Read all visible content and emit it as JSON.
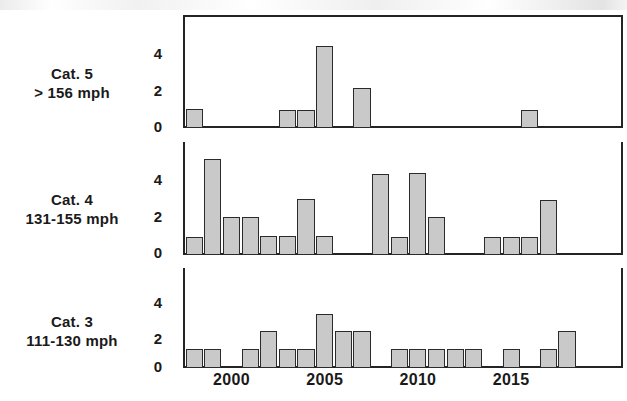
{
  "figure": {
    "title": "",
    "background": "#ffffff",
    "bar_fill": "#c9c9c9",
    "bar_edge": "#2b2b2b",
    "axis_color": "#242424"
  },
  "panels": [
    {
      "key": "cat5",
      "label_line1": "Cat. 5",
      "label_line2": "> 156 mph",
      "yticks": [
        "4",
        "2",
        "0"
      ]
    },
    {
      "key": "cat4",
      "label_line1": "Cat. 4",
      "label_line2": "131-155 mph",
      "yticks": [
        "4",
        "2",
        "0"
      ]
    },
    {
      "key": "cat3",
      "label_line1": "Cat. 3",
      "label_line2": "111-130 mph",
      "yticks": [
        "4",
        "2",
        "0"
      ]
    }
  ],
  "xticks": [
    "2000",
    "2005",
    "2010",
    "2015"
  ],
  "chart_data": {
    "type": "bar",
    "title": "",
    "xlabel": "",
    "ylabel": "",
    "xlim": [
      1997.4,
      2021.0
    ],
    "ylim": [
      0,
      5.4
    ],
    "yticks": [
      0,
      2,
      4
    ],
    "xticks": [
      2000,
      2005,
      2010,
      2015
    ],
    "grid": false,
    "legend": "none",
    "layout": "3 stacked panels sharing one x axis",
    "panels": [
      {
        "name": "Cat. 5",
        "subtitle": "> 156 mph",
        "ylabel": "Cat. 5 > 156 mph",
        "x": [
          1998,
          2003,
          2004,
          2005,
          2007,
          2016
        ],
        "values": [
          0.9,
          0.85,
          0.85,
          3.9,
          1.9,
          0.85
        ],
        "categories": [
          "1998",
          "2003",
          "2004",
          "2005",
          "2007",
          "2016"
        ]
      },
      {
        "name": "Cat. 4",
        "subtitle": "131-155 mph",
        "ylabel": "Cat. 4 131-155 mph",
        "x": [
          1998,
          1999,
          2000,
          2001,
          2002,
          2003,
          2004,
          2005,
          2008,
          2009,
          2010,
          2011,
          2014,
          2015,
          2016,
          2017
        ],
        "values": [
          0.85,
          4.6,
          1.8,
          1.8,
          0.9,
          0.9,
          2.7,
          0.9,
          3.85,
          0.85,
          3.9,
          1.8,
          0.85,
          0.85,
          0.85,
          2.65
        ],
        "categories": [
          "1998",
          "1999",
          "2000",
          "2001",
          "2002",
          "2003",
          "2004",
          "2005",
          "2008",
          "2009",
          "2010",
          "2011",
          "2014",
          "2015",
          "2016",
          "2017"
        ]
      },
      {
        "name": "Cat. 3",
        "subtitle": "111-130 mph",
        "ylabel": "Cat. 3 111-130 mph",
        "x": [
          1998,
          1999,
          2001,
          2002,
          2003,
          2004,
          2005,
          2006,
          2007,
          2009,
          2010,
          2011,
          2012,
          2013,
          2015,
          2017,
          2018
        ],
        "values": [
          1.0,
          1.0,
          1.0,
          2.0,
          1.0,
          1.0,
          2.9,
          2.0,
          2.0,
          1.0,
          1.0,
          1.0,
          1.0,
          1.0,
          1.0,
          1.0,
          2.0
        ],
        "categories": [
          "1998",
          "1999",
          "2001",
          "2002",
          "2003",
          "2004",
          "2005",
          "2006",
          "2007",
          "2009",
          "2010",
          "2011",
          "2012",
          "2013",
          "2015",
          "2017",
          "2018"
        ]
      }
    ]
  }
}
